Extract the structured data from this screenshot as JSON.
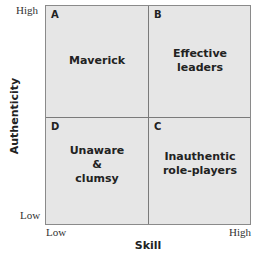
{
  "diagram": {
    "type": "2x2 matrix",
    "y_axis": {
      "title": "Authenticity",
      "high": "High",
      "low": "Low"
    },
    "x_axis": {
      "title": "Skill",
      "low": "Low",
      "high": "High"
    },
    "quadrants": [
      {
        "letter": "A",
        "label": "Maverick",
        "position": "top-left"
      },
      {
        "letter": "B",
        "label": "Effective\nleaders",
        "position": "top-right"
      },
      {
        "letter": "D",
        "label": "Unaware\n&\nclumsy",
        "position": "bottom-left"
      },
      {
        "letter": "C",
        "label": "Inauthentic\nrole-players",
        "position": "bottom-right"
      }
    ],
    "colors": {
      "fill": "#e6e6e6",
      "border": "#8a8a8a",
      "text": "#222222"
    }
  }
}
